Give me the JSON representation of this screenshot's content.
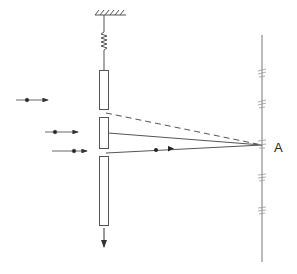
{
  "diagram": {
    "labels": {
      "point_a": "A"
    },
    "colors": {
      "stroke": "#555555",
      "background": "#ffffff"
    },
    "elements": {
      "ceiling": "hatched-support",
      "spring": "spring",
      "slit_plate_segments": 3,
      "incident_particles": 3,
      "screen_marks": 5,
      "motion_direction": "down"
    }
  }
}
